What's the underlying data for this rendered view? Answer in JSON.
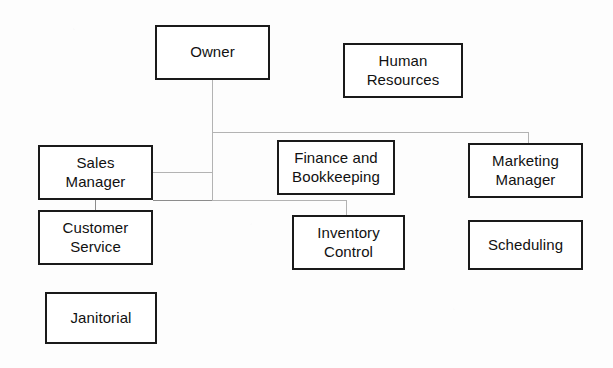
{
  "diagram": {
    "type": "organizational-chart",
    "background_color": "#fdfdfd",
    "box_border_color": "#1a1a1a",
    "connector_color": "#b3b3b3",
    "nodes": [
      {
        "id": "owner",
        "label": "Owner",
        "x": 155,
        "y": 25,
        "w": 115,
        "h": 55
      },
      {
        "id": "human-resources",
        "label": "Human\nResources",
        "x": 343,
        "y": 43,
        "w": 120,
        "h": 55
      },
      {
        "id": "sales-manager",
        "label": "Sales\nManager",
        "x": 38,
        "y": 145,
        "w": 115,
        "h": 55
      },
      {
        "id": "finance-and-bookkeeping",
        "label": "Finance and\nBookkeeping",
        "x": 277,
        "y": 140,
        "w": 118,
        "h": 55
      },
      {
        "id": "marketing-manager",
        "label": "Marketing\nManager",
        "x": 468,
        "y": 143,
        "w": 115,
        "h": 55
      },
      {
        "id": "customer-service",
        "label": "Customer\nService",
        "x": 38,
        "y": 210,
        "w": 115,
        "h": 55
      },
      {
        "id": "inventory-control",
        "label": "Inventory\nControl",
        "x": 292,
        "y": 215,
        "w": 113,
        "h": 55
      },
      {
        "id": "scheduling",
        "label": "Scheduling",
        "x": 468,
        "y": 220,
        "w": 115,
        "h": 50
      },
      {
        "id": "janitorial",
        "label": "Janitorial",
        "x": 45,
        "y": 292,
        "w": 112,
        "h": 52
      }
    ],
    "connectors": [
      {
        "id": "owner-stem",
        "orient": "v",
        "x": 212,
        "y": 80,
        "len": 52,
        "from": "owner",
        "to": "spine"
      },
      {
        "id": "spine-horizontal",
        "orient": "h",
        "x": 212,
        "y": 132,
        "len": 317,
        "from": "owner",
        "to": "marketing-manager"
      },
      {
        "id": "marketing-drop",
        "orient": "v",
        "x": 528,
        "y": 132,
        "len": 12,
        "from": "spine",
        "to": "marketing-manager"
      },
      {
        "id": "trunk-vertical",
        "orient": "v",
        "x": 212,
        "y": 132,
        "len": 69,
        "from": "spine",
        "to": "lower-branch"
      },
      {
        "id": "sales-branch-upper",
        "orient": "h",
        "x": 153,
        "y": 172,
        "len": 60,
        "from": "sales-manager",
        "to": "trunk"
      },
      {
        "id": "sales-branch-lower",
        "orient": "h",
        "x": 153,
        "y": 200,
        "len": 60,
        "from": "sales-manager",
        "to": "trunk"
      },
      {
        "id": "inventory-branch",
        "orient": "h",
        "x": 212,
        "y": 200,
        "len": 134,
        "from": "trunk",
        "to": "inventory-control"
      },
      {
        "id": "inventory-drop",
        "orient": "v",
        "x": 346,
        "y": 200,
        "len": 16,
        "from": "branch",
        "to": "inventory-control"
      },
      {
        "id": "customer-service-stem",
        "orient": "v",
        "x": 95,
        "y": 200,
        "len": 11,
        "from": "sales-manager",
        "to": "customer-service"
      }
    ],
    "unconnected_nodes": [
      "human-resources",
      "scheduling",
      "janitorial"
    ]
  }
}
